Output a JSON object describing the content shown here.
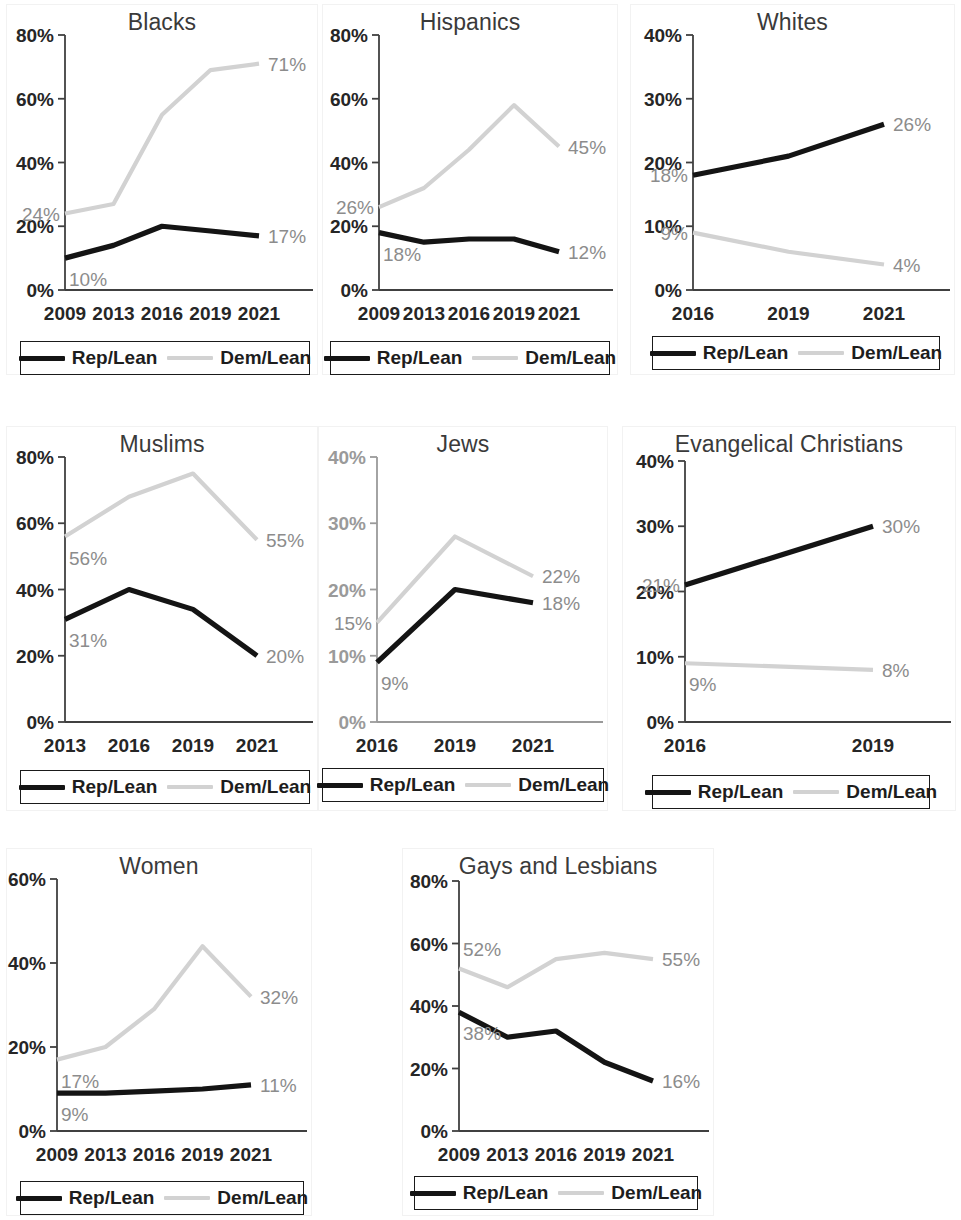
{
  "colors": {
    "rep_line": "#141414",
    "dem_line": "#d2d2d2",
    "axis": "#404040",
    "data_label": "#8c8c8c",
    "tick_dark": "#262626",
    "tick_gray": "#9a9a9a",
    "panel_border": "#f2f2f2"
  },
  "legend": {
    "rep_label": "Rep/Lean",
    "dem_label": "Dem/Lean"
  },
  "charts": [
    {
      "id": "blacks",
      "title": "Blacks",
      "chart_data": {
        "type": "line",
        "title": "Blacks",
        "xlabel": "",
        "ylabel": "",
        "x": [
          "2009",
          "2013",
          "2016",
          "2019",
          "2021"
        ],
        "ylim": [
          0,
          80
        ],
        "yticks": [
          "0%",
          "20%",
          "40%",
          "60%",
          "80%"
        ],
        "tick_color": "dark",
        "grid": false,
        "legend_position": "bottom",
        "series": [
          {
            "name": "Rep/Lean",
            "values": [
              10,
              14,
              20,
              18.5,
              17
            ]
          },
          {
            "name": "Dem/Lean",
            "values": [
              24,
              27,
              55,
              69,
              71
            ]
          }
        ],
        "annotations": [
          {
            "text": "24%",
            "series": "Dem/Lean",
            "point": "2009",
            "side": "left"
          },
          {
            "text": "71%",
            "series": "Dem/Lean",
            "point": "2021",
            "side": "right"
          },
          {
            "text": "10%",
            "series": "Rep/Lean",
            "point": "2009",
            "side": "below"
          },
          {
            "text": "17%",
            "series": "Rep/Lean",
            "point": "2021",
            "side": "right"
          }
        ]
      }
    },
    {
      "id": "hispanics",
      "title": "Hispanics",
      "chart_data": {
        "type": "line",
        "title": "Hispanics",
        "xlabel": "",
        "ylabel": "",
        "x": [
          "2009",
          "2013",
          "2016",
          "2019",
          "2021"
        ],
        "ylim": [
          0,
          80
        ],
        "yticks": [
          "0%",
          "20%",
          "40%",
          "60%",
          "80%"
        ],
        "tick_color": "dark",
        "grid": false,
        "legend_position": "bottom",
        "series": [
          {
            "name": "Rep/Lean",
            "values": [
              18,
              15,
              16,
              16,
              12
            ]
          },
          {
            "name": "Dem/Lean",
            "values": [
              26,
              32,
              44,
              58,
              45
            ]
          }
        ],
        "annotations": [
          {
            "text": "26%",
            "series": "Dem/Lean",
            "point": "2009",
            "side": "left"
          },
          {
            "text": "45%",
            "series": "Dem/Lean",
            "point": "2021",
            "side": "right"
          },
          {
            "text": "18%",
            "series": "Rep/Lean",
            "point": "2009",
            "side": "below"
          },
          {
            "text": "12%",
            "series": "Rep/Lean",
            "point": "2021",
            "side": "right"
          }
        ]
      }
    },
    {
      "id": "whites",
      "title": "Whites",
      "chart_data": {
        "type": "line",
        "title": "Whites",
        "xlabel": "",
        "ylabel": "",
        "x": [
          "2016",
          "2019",
          "2021"
        ],
        "ylim": [
          0,
          40
        ],
        "yticks": [
          "0%",
          "10%",
          "20%",
          "30%",
          "40%"
        ],
        "tick_color": "dark",
        "grid": false,
        "legend_position": "bottom",
        "series": [
          {
            "name": "Rep/Lean",
            "values": [
              18,
              21,
              26
            ]
          },
          {
            "name": "Dem/Lean",
            "values": [
              9,
              6,
              4
            ]
          }
        ],
        "annotations": [
          {
            "text": "18%",
            "series": "Rep/Lean",
            "point": "2016",
            "side": "left"
          },
          {
            "text": "26%",
            "series": "Rep/Lean",
            "point": "2021",
            "side": "right"
          },
          {
            "text": "9%",
            "series": "Dem/Lean",
            "point": "2016",
            "side": "left"
          },
          {
            "text": "4%",
            "series": "Dem/Lean",
            "point": "2021",
            "side": "right"
          }
        ]
      }
    },
    {
      "id": "muslims",
      "title": "Muslims",
      "chart_data": {
        "type": "line",
        "title": "Muslims",
        "xlabel": "",
        "ylabel": "",
        "x": [
          "2013",
          "2016",
          "2019",
          "2021"
        ],
        "ylim": [
          0,
          80
        ],
        "yticks": [
          "0%",
          "20%",
          "40%",
          "60%",
          "80%"
        ],
        "tick_color": "dark",
        "grid": false,
        "legend_position": "bottom",
        "series": [
          {
            "name": "Rep/Lean",
            "values": [
              31,
              40,
              34,
              20
            ]
          },
          {
            "name": "Dem/Lean",
            "values": [
              56,
              68,
              75,
              55
            ]
          }
        ],
        "annotations": [
          {
            "text": "56%",
            "series": "Dem/Lean",
            "point": "2013",
            "side": "below"
          },
          {
            "text": "55%",
            "series": "Dem/Lean",
            "point": "2021",
            "side": "right"
          },
          {
            "text": "31%",
            "series": "Rep/Lean",
            "point": "2013",
            "side": "below"
          },
          {
            "text": "20%",
            "series": "Rep/Lean",
            "point": "2021",
            "side": "right"
          }
        ]
      }
    },
    {
      "id": "jews",
      "title": "Jews",
      "chart_data": {
        "type": "line",
        "title": "Jews",
        "xlabel": "",
        "ylabel": "",
        "x": [
          "2016",
          "2019",
          "2021"
        ],
        "ylim": [
          0,
          40
        ],
        "yticks": [
          "0%",
          "10%",
          "20%",
          "30%",
          "40%"
        ],
        "tick_color": "gray",
        "grid": false,
        "legend_position": "bottom",
        "series": [
          {
            "name": "Rep/Lean",
            "values": [
              9,
              20,
              18
            ]
          },
          {
            "name": "Dem/Lean",
            "values": [
              15,
              28,
              22
            ]
          }
        ],
        "annotations": [
          {
            "text": "15%",
            "series": "Dem/Lean",
            "point": "2016",
            "side": "left"
          },
          {
            "text": "22%",
            "series": "Dem/Lean",
            "point": "2021",
            "side": "right"
          },
          {
            "text": "9%",
            "series": "Rep/Lean",
            "point": "2016",
            "side": "below"
          },
          {
            "text": "18%",
            "series": "Rep/Lean",
            "point": "2021",
            "side": "right"
          }
        ]
      }
    },
    {
      "id": "evangelical-christians",
      "title": "Evangelical Christians",
      "chart_data": {
        "type": "line",
        "title": "Evangelical Christians",
        "xlabel": "",
        "ylabel": "",
        "x": [
          "2016",
          "2019"
        ],
        "ylim": [
          0,
          40
        ],
        "yticks": [
          "0%",
          "10%",
          "20%",
          "30%",
          "40%"
        ],
        "tick_color": "dark",
        "grid": false,
        "legend_position": "bottom",
        "series": [
          {
            "name": "Rep/Lean",
            "values": [
              21,
              30
            ]
          },
          {
            "name": "Dem/Lean",
            "values": [
              9,
              8
            ]
          }
        ],
        "annotations": [
          {
            "text": "21%",
            "series": "Rep/Lean",
            "point": "2016",
            "side": "left"
          },
          {
            "text": "30%",
            "series": "Rep/Lean",
            "point": "2019",
            "side": "right"
          },
          {
            "text": "9%",
            "series": "Dem/Lean",
            "point": "2016",
            "side": "below"
          },
          {
            "text": "8%",
            "series": "Dem/Lean",
            "point": "2019",
            "side": "right"
          }
        ]
      }
    },
    {
      "id": "women",
      "title": "Women",
      "chart_data": {
        "type": "line",
        "title": "Women",
        "xlabel": "",
        "ylabel": "",
        "x": [
          "2009",
          "2013",
          "2016",
          "2019",
          "2021"
        ],
        "ylim": [
          0,
          60
        ],
        "yticks": [
          "0%",
          "20%",
          "40%",
          "60%"
        ],
        "tick_color": "dark",
        "grid": false,
        "legend_position": "bottom",
        "series": [
          {
            "name": "Rep/Lean",
            "values": [
              9,
              9,
              9.5,
              10,
              11
            ]
          },
          {
            "name": "Dem/Lean",
            "values": [
              17,
              20,
              29,
              44,
              32
            ]
          }
        ],
        "annotations": [
          {
            "text": "17%",
            "series": "Dem/Lean",
            "point": "2009",
            "side": "below"
          },
          {
            "text": "32%",
            "series": "Dem/Lean",
            "point": "2021",
            "side": "right"
          },
          {
            "text": "9%",
            "series": "Rep/Lean",
            "point": "2009",
            "side": "below"
          },
          {
            "text": "11%",
            "series": "Rep/Lean",
            "point": "2021",
            "side": "right"
          }
        ]
      }
    },
    {
      "id": "gays-and-lesbians",
      "title": "Gays and Lesbians",
      "chart_data": {
        "type": "line",
        "title": "Gays and Lesbians",
        "xlabel": "",
        "ylabel": "",
        "x": [
          "2009",
          "2013",
          "2016",
          "2019",
          "2021"
        ],
        "ylim": [
          0,
          80
        ],
        "yticks": [
          "0%",
          "20%",
          "40%",
          "60%",
          "80%"
        ],
        "tick_color": "dark",
        "grid": false,
        "legend_position": "bottom",
        "series": [
          {
            "name": "Rep/Lean",
            "values": [
              38,
              30,
              32,
              22,
              16
            ]
          },
          {
            "name": "Dem/Lean",
            "values": [
              52,
              46,
              55,
              57,
              55
            ]
          }
        ],
        "annotations": [
          {
            "text": "52%",
            "series": "Dem/Lean",
            "point": "2009",
            "side": "above"
          },
          {
            "text": "55%",
            "series": "Dem/Lean",
            "point": "2021",
            "side": "right"
          },
          {
            "text": "38%",
            "series": "Rep/Lean",
            "point": "2009",
            "side": "below"
          },
          {
            "text": "16%",
            "series": "Rep/Lean",
            "point": "2021",
            "side": "right"
          }
        ]
      }
    }
  ]
}
